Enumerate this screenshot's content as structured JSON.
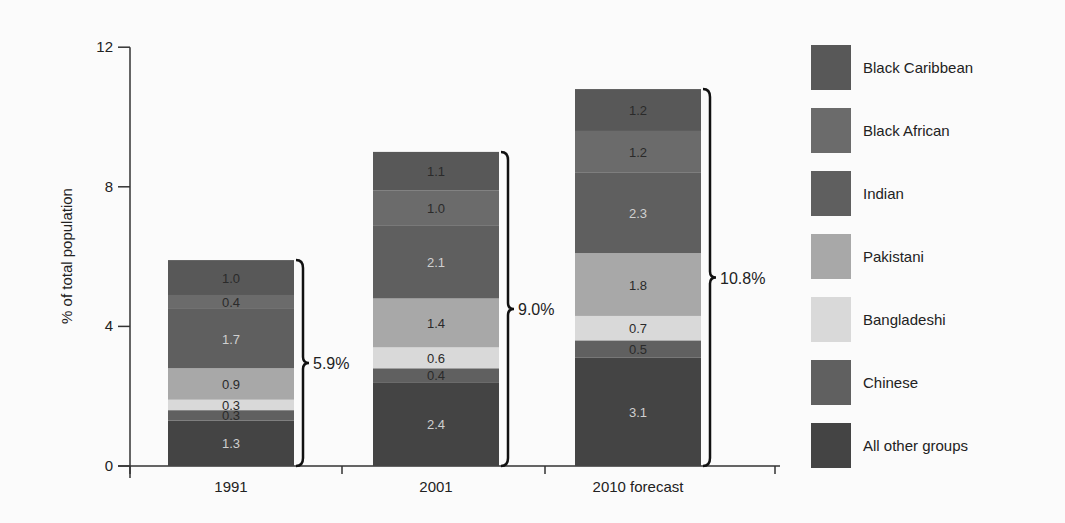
{
  "chart_data": {
    "type": "bar",
    "stacked": true,
    "title": "",
    "xlabel": "",
    "ylabel": "% of total population",
    "ylim": [
      0,
      12
    ],
    "yticks": [
      0,
      4,
      8,
      12
    ],
    "categories": [
      "1991",
      "2001",
      "2010 forecast"
    ],
    "series": [
      {
        "name": "All other groups",
        "values": [
          1.3,
          2.4,
          3.1
        ],
        "color": "#444444",
        "label_color": "#cfcfcf"
      },
      {
        "name": "Chinese",
        "values": [
          0.3,
          0.4,
          0.5
        ],
        "color": "#606060",
        "label_color": "#2a2a2a"
      },
      {
        "name": "Bangladeshi",
        "values": [
          0.3,
          0.6,
          0.7
        ],
        "color": "#d9d9d9",
        "label_color": "#2a2a2a"
      },
      {
        "name": "Pakistani",
        "values": [
          0.9,
          1.4,
          1.8
        ],
        "color": "#a8a8a8",
        "label_color": "#2a2a2a"
      },
      {
        "name": "Indian",
        "values": [
          1.7,
          2.1,
          2.3
        ],
        "color": "#5f5f5f",
        "label_color": "#d0d0d0"
      },
      {
        "name": "Black African",
        "values": [
          0.4,
          1.0,
          1.2
        ],
        "color": "#6b6b6b",
        "label_color": "#2a2a2a"
      },
      {
        "name": "Black Caribbean",
        "values": [
          1.0,
          1.1,
          1.2
        ],
        "color": "#585858",
        "label_color": "#2a2a2a"
      }
    ],
    "totals": [
      "5.9%",
      "9.0%",
      "10.8%"
    ],
    "legend_order": [
      "Black Caribbean",
      "Black African",
      "Indian",
      "Pakistani",
      "Bangladeshi",
      "Chinese",
      "All other groups"
    ],
    "legend_position": "right",
    "grid": false
  },
  "legend": {
    "items": [
      {
        "label": "Black Caribbean",
        "color": "#585858"
      },
      {
        "label": "Black African",
        "color": "#6b6b6b"
      },
      {
        "label": "Indian",
        "color": "#5f5f5f"
      },
      {
        "label": "Pakistani",
        "color": "#a8a8a8"
      },
      {
        "label": "Bangladeshi",
        "color": "#d9d9d9"
      },
      {
        "label": "Chinese",
        "color": "#606060"
      },
      {
        "label": "All other groups",
        "color": "#444444"
      }
    ]
  }
}
